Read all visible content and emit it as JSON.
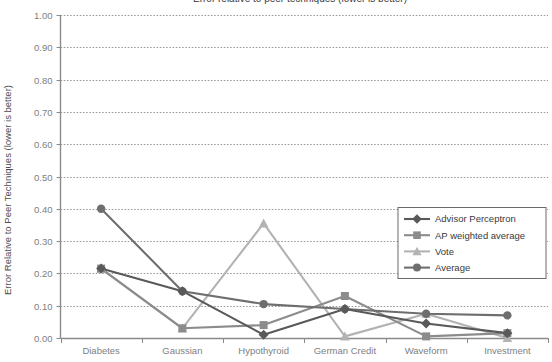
{
  "chart_data": {
    "type": "line",
    "title": "Error relative to peer techniques (lower is better)",
    "xlabel": "",
    "ylabel": "Error Relative to Peer Techniques (lower is better)",
    "ylim": [
      0.0,
      1.0
    ],
    "ytick_step": 0.1,
    "ytick_labels": [
      "1.00",
      "0.90",
      "0.80",
      "0.70",
      "0.60",
      "0.50",
      "0.40",
      "0.30",
      "0.20",
      "0.10",
      "0.00"
    ],
    "ytick_values": [
      1.0,
      0.9,
      0.8,
      0.7,
      0.6,
      0.5,
      0.4,
      0.3,
      0.2,
      0.1,
      0.0
    ],
    "grid": true,
    "grid_axis": "y",
    "legend_position": "inside-right",
    "categories": [
      "Diabetes",
      "Gaussian",
      "Hypothyroid",
      "German Credit",
      "Waveform",
      "Investment"
    ],
    "series": [
      {
        "name": "Advisor Perceptron",
        "marker": "diamond",
        "color": "#595959",
        "values": [
          0.215,
          0.145,
          0.01,
          0.09,
          0.045,
          0.015
        ]
      },
      {
        "name": "AP weighted average",
        "marker": "square",
        "color": "#8c8c8c",
        "values": [
          0.215,
          0.03,
          0.04,
          0.13,
          0.005,
          0.015
        ]
      },
      {
        "name": "Vote",
        "marker": "triangle",
        "color": "#b3b3b3",
        "values": [
          0.215,
          0.03,
          0.355,
          0.005,
          0.075,
          0.0
        ]
      },
      {
        "name": "Average",
        "marker": "circle",
        "color": "#6e6e6e",
        "values": [
          0.4,
          0.145,
          0.105,
          0.09,
          0.075,
          0.07
        ]
      }
    ]
  },
  "legend": {
    "entries": [
      {
        "label": "Advisor Perceptron"
      },
      {
        "label": "AP weighted average"
      },
      {
        "label": "Vote"
      },
      {
        "label": "Average"
      }
    ]
  },
  "colors": {
    "axis": "#808080",
    "grid": "#9a9a9a",
    "background": "#ffffff",
    "legend_border": "#6a6a6a",
    "text": "#808080"
  }
}
